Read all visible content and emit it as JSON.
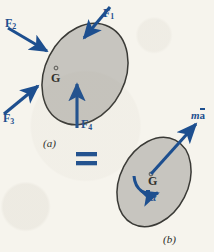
{
  "figure": {
    "background_color": "#f6f4ed",
    "body_fill": "#c7c5bf",
    "body_stroke": "#3a3a36",
    "vector_color": "#1d4f8f",
    "equals_sign": "=",
    "panel_a_label": "(a)",
    "panel_b_label": "(b)"
  },
  "panel_a": {
    "caption": "(a)",
    "center_label": "G",
    "forces": [
      {
        "name": "F",
        "subscript": "1",
        "label": "F1"
      },
      {
        "name": "F",
        "subscript": "2",
        "label": "F2"
      },
      {
        "name": "F",
        "subscript": "3",
        "label": "F3"
      },
      {
        "name": "F",
        "subscript": "4",
        "label": "F4"
      }
    ]
  },
  "panel_b": {
    "caption": "(b)",
    "center_label": "G",
    "resultant_force": {
      "prefix": "m",
      "barred": "a",
      "label": "ma"
    },
    "resultant_moment": {
      "barred": "I",
      "suffix": "α",
      "label": "Iα"
    }
  }
}
